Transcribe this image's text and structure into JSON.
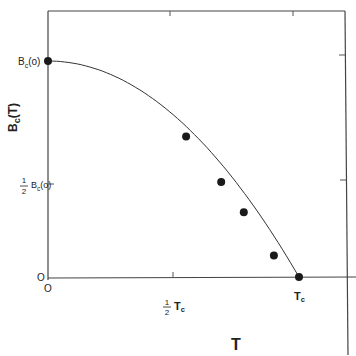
{
  "chart_data": {
    "type": "line",
    "title": "",
    "xlabel": "T",
    "ylabel": "Bc(T)",
    "x_ticks": [
      {
        "label": "0",
        "value": 0
      },
      {
        "label": "½ Tc",
        "value": 0.5
      },
      {
        "label": "Tc",
        "value": 1.0
      }
    ],
    "y_ticks": [
      {
        "label": "0",
        "value": 0
      },
      {
        "label": "½ Bc(0)",
        "value": 0.5
      },
      {
        "label": "Bc(0)",
        "value": 1.0
      }
    ],
    "xlim": [
      0,
      1.2
    ],
    "ylim": [
      0,
      1.2
    ],
    "grid": false,
    "legend": null,
    "series": [
      {
        "name": "Bc(T) = Bc(0)[1 - (T/Tc)^2]",
        "kind": "curve",
        "x": [
          0,
          0.1,
          0.2,
          0.3,
          0.4,
          0.5,
          0.6,
          0.7,
          0.8,
          0.9,
          1.0
        ],
        "y": [
          1.0,
          0.99,
          0.96,
          0.91,
          0.84,
          0.75,
          0.64,
          0.51,
          0.36,
          0.19,
          0.0
        ]
      },
      {
        "name": "measured points",
        "kind": "scatter",
        "x": [
          0,
          0.55,
          0.69,
          0.78,
          0.9,
          1.0
        ],
        "y": [
          1.0,
          0.65,
          0.44,
          0.3,
          0.1,
          0.0
        ]
      }
    ]
  },
  "labels": {
    "y_top": "Bc(o)",
    "y_half_frac_num": "1",
    "y_half_frac_den": "2",
    "y_half": "Bc(o)",
    "y_zero": "O",
    "x_zero": "O",
    "x_half_frac_num": "1",
    "x_half_frac_den": "2",
    "x_half": "Tc",
    "x_end": "Tc",
    "x_axis_title": "T",
    "y_axis_title": "Bc(T)"
  }
}
